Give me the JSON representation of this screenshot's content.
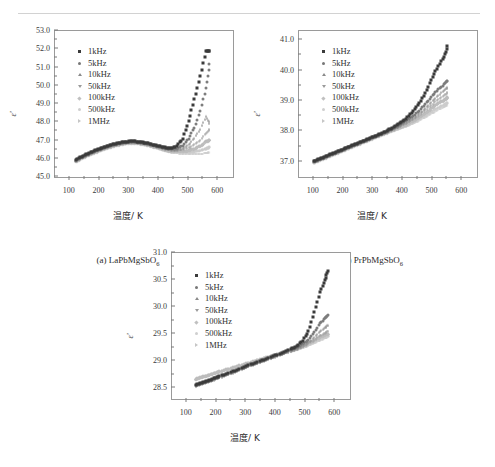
{
  "figure": {
    "x_axis_label": "温度/ K",
    "y_axis_label": "ε'",
    "legend_labels": [
      "1kHz",
      "5kHz",
      "10kHz",
      "50kHz",
      "100kHz",
      "500kHz",
      "1MHz"
    ],
    "marker_shapes": [
      "square",
      "circle",
      "triangle-up",
      "triangle-down",
      "diamond",
      "light-circle",
      "triangle-right"
    ],
    "series_colors": [
      "#3b3b3b",
      "#7d7d7d",
      "#949494",
      "#a4a4a4",
      "#bdbdbd",
      "#cccccc",
      "#c9c9c9"
    ]
  },
  "captions": {
    "a": "(a) LaPbMgSbO6",
    "b": "(b) PrPbMgSbO6",
    "c": "(c) NdPbMgSbO6"
  },
  "chart_data": [
    {
      "type": "scatter",
      "id": "a",
      "title": "(a) LaPbMgSbO6",
      "xlabel": "温度/ K",
      "ylabel": "ε'",
      "xlim": [
        50,
        650
      ],
      "ylim": [
        45.0,
        53.0
      ],
      "xticks": [
        100,
        200,
        300,
        400,
        500,
        600
      ],
      "yticks": [
        45.0,
        46.0,
        47.0,
        48.0,
        49.0,
        50.0,
        51.0,
        52.0,
        53.0
      ],
      "grid": false,
      "legend_position": "upper-left",
      "x": [
        120,
        140,
        160,
        180,
        200,
        220,
        240,
        260,
        280,
        300,
        320,
        340,
        360,
        380,
        400,
        420,
        440,
        460,
        480,
        500,
        520,
        540,
        560,
        570
      ],
      "series": [
        {
          "name": "1kHz",
          "values": [
            45.95,
            46.12,
            46.28,
            46.42,
            46.55,
            46.66,
            46.76,
            46.85,
            46.92,
            46.95,
            46.95,
            46.92,
            46.86,
            46.78,
            46.7,
            46.62,
            46.58,
            46.7,
            47.1,
            48.05,
            49.25,
            50.55,
            51.9,
            51.9
          ]
        },
        {
          "name": "5kHz",
          "values": [
            45.92,
            46.09,
            46.25,
            46.39,
            46.52,
            46.63,
            46.73,
            46.82,
            46.89,
            46.92,
            46.92,
            46.89,
            46.83,
            46.75,
            46.67,
            46.59,
            46.53,
            46.56,
            46.72,
            47.1,
            47.7,
            48.6,
            49.9,
            51.2
          ]
        },
        {
          "name": "10kHz",
          "values": [
            45.9,
            46.07,
            46.23,
            46.37,
            46.5,
            46.61,
            46.71,
            46.8,
            46.87,
            46.9,
            46.9,
            46.87,
            46.81,
            46.73,
            46.65,
            46.56,
            46.5,
            46.5,
            46.58,
            46.8,
            47.15,
            47.65,
            48.35,
            47.95
          ]
        },
        {
          "name": "50kHz",
          "values": [
            45.88,
            46.05,
            46.21,
            46.35,
            46.48,
            46.59,
            46.69,
            46.78,
            46.85,
            46.88,
            46.88,
            46.85,
            46.79,
            46.71,
            46.62,
            46.53,
            46.46,
            46.44,
            46.47,
            46.57,
            46.75,
            47.0,
            47.38,
            47.55
          ]
        },
        {
          "name": "100kHz",
          "values": [
            45.86,
            46.03,
            46.19,
            46.33,
            46.46,
            46.57,
            46.67,
            46.76,
            46.83,
            46.86,
            46.86,
            46.83,
            46.77,
            46.69,
            46.6,
            46.5,
            46.43,
            46.4,
            46.4,
            46.46,
            46.56,
            46.72,
            46.95,
            47.05
          ]
        },
        {
          "name": "500kHz",
          "values": [
            45.84,
            46.01,
            46.17,
            46.31,
            46.44,
            46.55,
            46.65,
            46.74,
            46.81,
            46.84,
            46.84,
            46.81,
            46.75,
            46.66,
            46.57,
            46.47,
            46.39,
            46.35,
            46.33,
            46.34,
            46.38,
            46.45,
            46.55,
            46.62
          ]
        },
        {
          "name": "1MHz",
          "values": [
            45.82,
            45.99,
            46.15,
            46.29,
            46.42,
            46.53,
            46.63,
            46.72,
            46.79,
            46.82,
            46.82,
            46.79,
            46.73,
            46.64,
            46.54,
            46.44,
            46.35,
            46.3,
            46.26,
            46.24,
            46.24,
            46.26,
            46.3,
            46.35
          ]
        }
      ]
    },
    {
      "type": "scatter",
      "id": "b",
      "title": "(b) PrPbMgSbO6",
      "xlabel": "温度/ K",
      "ylabel": "ε'",
      "xlim": [
        50,
        650
      ],
      "ylim": [
        36.5,
        41.3
      ],
      "xticks": [
        100,
        200,
        300,
        400,
        500,
        600
      ],
      "yticks": [
        37.0,
        38.0,
        39.0,
        40.0,
        41.0
      ],
      "grid": false,
      "legend_position": "upper-left",
      "x": [
        100,
        120,
        140,
        160,
        180,
        200,
        220,
        240,
        260,
        280,
        300,
        320,
        340,
        360,
        380,
        400,
        420,
        440,
        460,
        480,
        500,
        520,
        540,
        550
      ],
      "series": [
        {
          "name": "1kHz",
          "values": [
            37.02,
            37.1,
            37.18,
            37.26,
            37.34,
            37.42,
            37.5,
            37.58,
            37.66,
            37.74,
            37.82,
            37.9,
            37.99,
            38.09,
            38.2,
            38.33,
            38.5,
            38.72,
            39.0,
            39.35,
            39.8,
            40.15,
            40.45,
            40.8
          ]
        },
        {
          "name": "5kHz",
          "values": [
            37.01,
            37.09,
            37.17,
            37.25,
            37.33,
            37.41,
            37.49,
            37.57,
            37.65,
            37.73,
            37.81,
            37.89,
            37.97,
            38.06,
            38.16,
            38.27,
            38.4,
            38.55,
            38.73,
            38.95,
            39.18,
            39.38,
            39.55,
            39.67
          ]
        },
        {
          "name": "10kHz",
          "values": [
            37.0,
            37.08,
            37.16,
            37.24,
            37.32,
            37.4,
            37.48,
            37.56,
            37.64,
            37.72,
            37.8,
            37.88,
            37.96,
            38.04,
            38.13,
            38.23,
            38.35,
            38.48,
            38.63,
            38.82,
            39.02,
            39.2,
            39.36,
            39.46
          ]
        },
        {
          "name": "50kHz",
          "values": [
            36.99,
            37.07,
            37.15,
            37.23,
            37.31,
            37.39,
            37.47,
            37.55,
            37.63,
            37.71,
            37.79,
            37.87,
            37.95,
            38.03,
            38.11,
            38.2,
            38.3,
            38.42,
            38.55,
            38.71,
            38.88,
            39.04,
            39.16,
            39.25
          ]
        },
        {
          "name": "100kHz",
          "values": [
            36.98,
            37.06,
            37.14,
            37.22,
            37.3,
            37.38,
            37.46,
            37.54,
            37.62,
            37.7,
            37.78,
            37.86,
            37.94,
            38.02,
            38.1,
            38.18,
            38.27,
            38.38,
            38.5,
            38.64,
            38.79,
            38.93,
            39.04,
            39.12
          ]
        },
        {
          "name": "500kHz",
          "values": [
            36.97,
            37.05,
            37.13,
            37.21,
            37.29,
            37.37,
            37.45,
            37.53,
            37.61,
            37.69,
            37.77,
            37.85,
            37.93,
            38.0,
            38.07,
            38.14,
            38.22,
            38.31,
            38.42,
            38.54,
            38.66,
            38.78,
            38.87,
            38.94
          ]
        },
        {
          "name": "1MHz",
          "values": [
            36.96,
            37.04,
            37.12,
            37.2,
            37.28,
            37.36,
            37.44,
            37.52,
            37.6,
            37.68,
            37.76,
            37.84,
            37.91,
            37.98,
            38.05,
            38.12,
            38.19,
            38.27,
            38.37,
            38.48,
            38.59,
            38.7,
            38.79,
            38.86
          ]
        }
      ]
    },
    {
      "type": "scatter",
      "id": "c",
      "title": "(c) NdPbMgSbO6",
      "xlabel": "温度/ K",
      "ylabel": "ε'",
      "xlim": [
        50,
        650
      ],
      "ylim": [
        28.3,
        31.0
      ],
      "xticks": [
        100,
        200,
        300,
        400,
        500,
        600
      ],
      "yticks": [
        28.5,
        29.0,
        29.5,
        30.0,
        30.5,
        31.0
      ],
      "grid": false,
      "legend_position": "upper-left",
      "x": [
        130,
        150,
        170,
        190,
        210,
        240,
        270,
        300,
        330,
        360,
        390,
        420,
        450,
        470,
        490,
        510,
        530,
        550,
        565,
        575
      ],
      "series": [
        {
          "name": "1kHz",
          "values": [
            28.56,
            28.6,
            28.64,
            28.68,
            28.72,
            28.78,
            28.84,
            28.91,
            28.97,
            29.03,
            29.09,
            29.15,
            29.22,
            29.28,
            29.38,
            29.55,
            29.9,
            30.28,
            30.5,
            30.67
          ]
        },
        {
          "name": "5kHz",
          "values": [
            28.55,
            28.59,
            28.63,
            28.67,
            28.71,
            28.77,
            28.83,
            28.9,
            28.96,
            29.02,
            29.08,
            29.14,
            29.2,
            29.25,
            29.31,
            29.4,
            29.54,
            29.7,
            29.8,
            29.85
          ]
        },
        {
          "name": "10kHz",
          "values": [
            28.54,
            28.58,
            28.62,
            28.66,
            28.7,
            28.76,
            28.82,
            28.89,
            28.95,
            29.01,
            29.07,
            29.13,
            29.19,
            29.23,
            29.28,
            29.35,
            29.45,
            29.56,
            29.63,
            29.67
          ]
        },
        {
          "name": "50kHz",
          "values": [
            28.53,
            28.57,
            28.61,
            28.65,
            28.69,
            28.75,
            28.81,
            28.88,
            28.94,
            29.0,
            29.06,
            29.12,
            29.17,
            29.21,
            29.26,
            29.31,
            29.38,
            29.46,
            29.51,
            29.54
          ]
        },
        {
          "name": "100kHz",
          "values": [
            28.67,
            28.71,
            28.74,
            28.78,
            28.81,
            28.86,
            28.91,
            28.96,
            29.01,
            29.06,
            29.11,
            29.16,
            29.21,
            29.24,
            29.28,
            29.33,
            29.39,
            29.45,
            29.49,
            29.51
          ]
        },
        {
          "name": "500kHz",
          "values": [
            28.66,
            28.7,
            28.73,
            28.77,
            28.8,
            28.85,
            28.9,
            28.95,
            29.0,
            29.05,
            29.1,
            29.15,
            29.19,
            29.22,
            29.26,
            29.3,
            29.35,
            29.41,
            29.45,
            29.47
          ]
        },
        {
          "name": "1MHz",
          "values": [
            28.65,
            28.69,
            28.72,
            28.76,
            28.79,
            28.84,
            28.89,
            28.94,
            28.99,
            29.04,
            29.09,
            29.13,
            29.17,
            29.2,
            29.24,
            29.28,
            29.33,
            29.38,
            29.42,
            29.44
          ]
        }
      ]
    }
  ]
}
